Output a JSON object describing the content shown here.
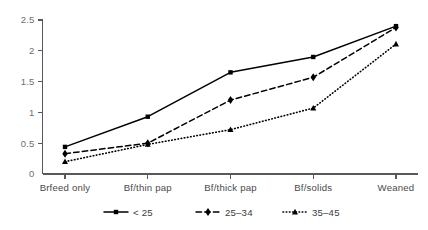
{
  "chart_data": {
    "type": "line",
    "title": "",
    "xlabel": "",
    "ylabel": "",
    "categories": [
      "Brfeed only",
      "Bf/thin pap",
      "Bf/thick pap",
      "Bf/solids",
      "Weaned"
    ],
    "ylim": [
      0,
      2.5
    ],
    "yticks": [
      0,
      0.5,
      1,
      1.5,
      2,
      2.5
    ],
    "ytick_labels": [
      "0",
      "0.5",
      "1",
      "1.5",
      "2",
      "2.5"
    ],
    "grid": false,
    "legend_position": "bottom",
    "series": [
      {
        "name": "< 25",
        "values": [
          0.44,
          0.93,
          1.65,
          1.9,
          2.4
        ],
        "line_style": "solid",
        "marker": "square",
        "color": "#000000"
      },
      {
        "name": "25–34",
        "values": [
          0.33,
          0.5,
          1.2,
          1.57,
          2.38
        ],
        "line_style": "dashed",
        "marker": "diamond",
        "color": "#000000"
      },
      {
        "name": "35–45",
        "values": [
          0.2,
          0.48,
          0.72,
          1.07,
          2.11
        ],
        "line_style": "dotted",
        "marker": "triangle",
        "color": "#000000"
      }
    ]
  },
  "axes": {
    "axis_color": "#58595b",
    "tick_label_color": "#6d6e71"
  }
}
